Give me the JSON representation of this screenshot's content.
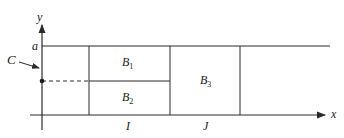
{
  "diagram": {
    "axes": {
      "x_label": "x",
      "y_label": "y"
    },
    "level_label": "a",
    "point_label": "C",
    "regions": [
      {
        "id": "B1",
        "base": "B",
        "sub": "1"
      },
      {
        "id": "B2",
        "base": "B",
        "sub": "2"
      },
      {
        "id": "B3",
        "base": "B",
        "sub": "3"
      }
    ],
    "intervals": [
      {
        "id": "I",
        "label": "I"
      },
      {
        "id": "J",
        "label": "J"
      }
    ],
    "colors": {
      "line": "#2a2a2a",
      "background": "#ffffff"
    }
  }
}
